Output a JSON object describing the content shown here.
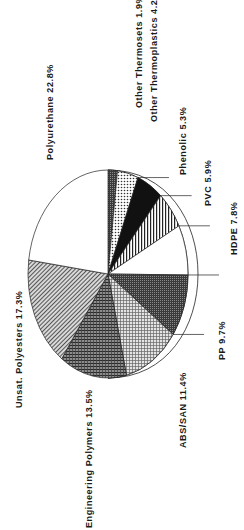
{
  "chart_data": {
    "type": "pie",
    "title": "",
    "orientation": "rotated-90-clockwise",
    "style": "3d-tilted",
    "slices": [
      {
        "label": "Other Thermosets",
        "value": 1.9,
        "display": "Other Thermosets 1.9%",
        "pattern": "dark-stipple"
      },
      {
        "label": "Other Thermoplastics",
        "value": 4.2,
        "display": "Other Thermoplastics 4.2%",
        "pattern": "dots"
      },
      {
        "label": "Phenolic",
        "value": 5.3,
        "display": "Phenolic 5.3%",
        "pattern": "solid-black"
      },
      {
        "label": "PVC",
        "value": 5.9,
        "display": "PVC 5.9%",
        "pattern": "vertical-hatch"
      },
      {
        "label": "HDPE",
        "value": 7.8,
        "display": "HDPE 7.8%",
        "pattern": "white"
      },
      {
        "label": "PP",
        "value": 9.7,
        "display": "PP 9.7%",
        "pattern": "dark-stipple"
      },
      {
        "label": "ABS/SAN",
        "value": 11.4,
        "display": "ABS/SAN 11.4%",
        "pattern": "light-grid"
      },
      {
        "label": "Engineering Polymers",
        "value": 13.5,
        "display": "Engineering Polymers 13.5%",
        "pattern": "dark-grid"
      },
      {
        "label": "Unsat. Polyesters",
        "value": 17.3,
        "display": "Unsat. Polyesters 17.3%",
        "pattern": "diagonal-hatch"
      },
      {
        "label": "Polyurethane",
        "value": 22.8,
        "display": "Polyurethane 22.8%",
        "pattern": "white"
      }
    ],
    "unit": "%"
  }
}
